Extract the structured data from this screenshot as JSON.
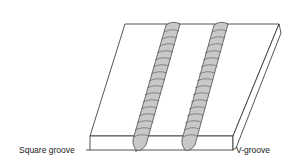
{
  "diagram": {
    "labels": {
      "left": "Square groove",
      "right": "V-groove"
    },
    "colors": {
      "outline": "#2a2a2a",
      "bead_fill": "#c8c8c8",
      "bead_ripple": "#555555",
      "background": "#ffffff"
    }
  }
}
